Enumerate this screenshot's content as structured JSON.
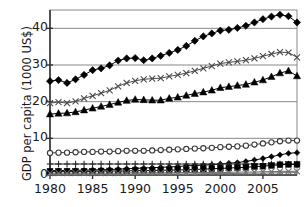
{
  "chart_data": {
    "type": "line",
    "title": "",
    "xlabel": "",
    "ylabel": "GDP per capita (1000 US$)",
    "xlim": [
      1980,
      2009
    ],
    "ylim": [
      0,
      45
    ],
    "yticks": [
      0,
      10,
      20,
      30,
      40
    ],
    "ytick_labels": [
      "0",
      "10",
      "20",
      "30",
      "40"
    ],
    "xticks": [
      1980,
      1985,
      1990,
      1995,
      2000,
      2005
    ],
    "xtick_labels": [
      "1980",
      "1985",
      "1990",
      "1995",
      "2000",
      "2005"
    ],
    "grid": "horizontal",
    "legend": "none",
    "x": [
      1980,
      1981,
      1982,
      1983,
      1984,
      1985,
      1986,
      1987,
      1988,
      1989,
      1990,
      1991,
      1992,
      1993,
      1994,
      1995,
      1996,
      1997,
      1998,
      1999,
      2000,
      2001,
      2002,
      2003,
      2004,
      2005,
      2006,
      2007,
      2008,
      2009
    ],
    "series": [
      {
        "name": "series-filled-diamond",
        "marker": "filled-diamond",
        "color": "#000000",
        "values": [
          25.6,
          25.9,
          25.1,
          26.1,
          27.3,
          28.6,
          29.1,
          29.9,
          31.2,
          31.8,
          31.9,
          31.3,
          31.8,
          32.5,
          33.3,
          34.1,
          35.2,
          36.6,
          37.8,
          38.6,
          39.4,
          39.6,
          40.1,
          40.7,
          41.6,
          42.5,
          43.2,
          43.7,
          43.3,
          41.6
        ]
      },
      {
        "name": "series-cross",
        "marker": "x-cross",
        "color": "#4a4a4a",
        "values": [
          19.6,
          19.9,
          19.6,
          20.1,
          20.9,
          21.6,
          22.3,
          23.1,
          24.2,
          25.1,
          25.7,
          26.1,
          26.3,
          26.4,
          26.9,
          27.3,
          27.8,
          28.4,
          29.1,
          29.7,
          30.4,
          30.7,
          31.0,
          31.3,
          31.8,
          32.4,
          33.0,
          33.5,
          33.4,
          32.1
        ]
      },
      {
        "name": "series-filled-triangle",
        "marker": "filled-triangle",
        "color": "#000000",
        "values": [
          16.6,
          16.8,
          16.9,
          17.2,
          17.7,
          18.2,
          18.7,
          19.2,
          19.8,
          20.3,
          20.6,
          20.5,
          20.4,
          20.4,
          20.9,
          21.2,
          21.7,
          22.2,
          22.6,
          23.1,
          23.8,
          24.1,
          24.4,
          24.7,
          25.3,
          25.9,
          26.8,
          27.8,
          28.4,
          27.0
        ]
      },
      {
        "name": "series-open-circle",
        "marker": "open-circle",
        "color": "#3a3a3a",
        "values": [
          6.0,
          6.1,
          6.1,
          6.2,
          6.3,
          6.3,
          6.4,
          6.4,
          6.5,
          6.6,
          6.6,
          6.6,
          6.7,
          6.8,
          6.9,
          7.0,
          7.1,
          7.2,
          7.3,
          7.4,
          7.6,
          7.7,
          7.8,
          8.0,
          8.3,
          8.6,
          8.9,
          9.2,
          9.4,
          9.4
        ]
      },
      {
        "name": "series-small-filled-diamond",
        "marker": "small-filled-diamond",
        "color": "#000000",
        "values": [
          1.2,
          1.2,
          1.2,
          1.3,
          1.3,
          1.4,
          1.4,
          1.5,
          1.6,
          1.7,
          1.8,
          1.9,
          2.0,
          2.1,
          2.2,
          2.3,
          2.5,
          2.6,
          2.7,
          2.8,
          3.0,
          3.2,
          3.4,
          3.7,
          4.1,
          4.5,
          5.0,
          5.5,
          5.9,
          6.1
        ]
      },
      {
        "name": "series-plus",
        "marker": "plus",
        "color": "#2a2a2a",
        "values": [
          3.0,
          3.0,
          3.0,
          3.0,
          3.0,
          3.0,
          3.0,
          3.0,
          3.0,
          3.0,
          3.0,
          3.0,
          3.0,
          3.0,
          3.0,
          3.0,
          3.0,
          3.0,
          3.0,
          3.0,
          3.0,
          3.0,
          3.0,
          3.0,
          3.0,
          3.0,
          3.0,
          3.0,
          3.0,
          3.0
        ]
      },
      {
        "name": "series-filled-square",
        "marker": "filled-square",
        "color": "#000000",
        "values": [
          1.0,
          1.0,
          1.0,
          1.0,
          1.0,
          1.0,
          1.1,
          1.1,
          1.1,
          1.1,
          1.2,
          1.2,
          1.2,
          1.3,
          1.3,
          1.4,
          1.4,
          1.5,
          1.6,
          1.7,
          1.8,
          1.9,
          2.0,
          2.1,
          2.3,
          2.4,
          2.6,
          2.8,
          2.9,
          2.9
        ]
      },
      {
        "name": "series-bottom-cross",
        "marker": "x-cross",
        "color": "#6a6a6a",
        "values": [
          0.5,
          0.5,
          0.5,
          0.5,
          0.5,
          0.5,
          0.5,
          0.5,
          0.5,
          0.6,
          0.6,
          0.6,
          0.6,
          0.6,
          0.6,
          0.6,
          0.7,
          0.7,
          0.7,
          0.7,
          0.7,
          0.7,
          0.8,
          0.8,
          0.8,
          0.9,
          0.9,
          1.0,
          1.0,
          1.0
        ]
      },
      {
        "name": "series-bottom-dash",
        "marker": "small-dot",
        "color": "#7a7a7a",
        "values": [
          0.2,
          0.2,
          0.2,
          0.2,
          0.2,
          0.2,
          0.2,
          0.2,
          0.2,
          0.2,
          0.3,
          0.3,
          0.3,
          0.3,
          0.3,
          0.3,
          0.3,
          0.3,
          0.4,
          0.4,
          0.4,
          0.4,
          0.4,
          0.5,
          0.5,
          0.5,
          0.6,
          0.6,
          0.7,
          0.7
        ]
      }
    ]
  },
  "plot": {
    "left": 50,
    "right": 297,
    "top": 10,
    "bottom": 175,
    "axis_color": "#555555",
    "grid_color": "#888888",
    "frame_color": "#8a8a8a"
  }
}
